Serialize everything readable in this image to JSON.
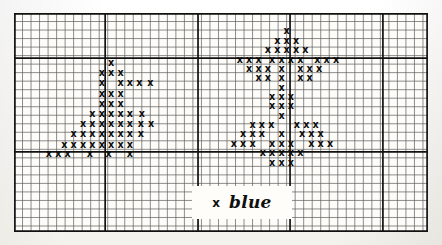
{
  "document": {
    "kind": "cross-stitch-pattern-chart",
    "title": "Cross-stitch chart",
    "paper_color": "#faf9f5",
    "grid_line_color": "#5d5d5d",
    "bold_line_color": "#111111",
    "stitch_color": "#0b0b0b"
  },
  "grid": {
    "left": 14,
    "top": 13,
    "cell_size": 8.52,
    "columns": 48.6,
    "rows": 25.7,
    "bold_columns": [
      0,
      10.7,
      21.6,
      32.4,
      43.3,
      48.6
    ],
    "bold_rows": [
      0,
      5.3,
      16.3,
      25.7
    ],
    "fine_lines_visible": true
  },
  "legend": {
    "symbol": "x",
    "label": "blue",
    "box_color": "#fefdfa"
  },
  "chart_data": {
    "type": "heatmap",
    "xlabel": "",
    "ylabel": "",
    "symbol": "x",
    "motifs": [
      {
        "name": "tree-motif",
        "position": "left",
        "rows": [
          {
            "y": 5.8,
            "cols": [
              11.4
            ]
          },
          {
            "y": 7.0,
            "cols": [
              10.3,
              11.4,
              12.5
            ]
          },
          {
            "y": 8.2,
            "cols": [
              10.3,
              12.5,
              13.6,
              14.7,
              16.0
            ]
          },
          {
            "y": 9.4,
            "cols": [
              10.3,
              11.4,
              12.5
            ]
          },
          {
            "y": 10.6,
            "cols": [
              10.3,
              11.4,
              12.5
            ]
          },
          {
            "y": 11.8,
            "cols": [
              9.2,
              10.3,
              11.4,
              12.5,
              13.6,
              15.0
            ]
          },
          {
            "y": 13.0,
            "cols": [
              8.1,
              9.2,
              10.3,
              11.4,
              12.5,
              13.6,
              14.9,
              16.1
            ]
          },
          {
            "y": 14.2,
            "cols": [
              7.0,
              8.1,
              9.2,
              10.3,
              11.4,
              12.5,
              13.6,
              14.9
            ]
          },
          {
            "y": 15.4,
            "cols": [
              5.9,
              7.0,
              8.1,
              9.2,
              10.3,
              11.4,
              12.5,
              13.6
            ]
          },
          {
            "y": 16.5,
            "cols": [
              4.1,
              5.2,
              6.3,
              8.9,
              11.1,
              13.6
            ]
          }
        ]
      },
      {
        "name": "star-motif",
        "position": "right",
        "rows": [
          {
            "y": 2.1,
            "cols": [
              32.0
            ]
          },
          {
            "y": 3.2,
            "cols": [
              30.9,
              32.0,
              33.1
            ]
          },
          {
            "y": 4.3,
            "cols": [
              29.8,
              30.9,
              32.0,
              33.1,
              34.2
            ]
          },
          {
            "y": 5.4,
            "cols": [
              26.5,
              27.6,
              28.7,
              30.3,
              31.4,
              32.5,
              33.6,
              35.6,
              36.7,
              37.8
            ]
          },
          {
            "y": 6.5,
            "cols": [
              27.6,
              28.7,
              29.8,
              31.4,
              33.6,
              34.7,
              35.8
            ]
          },
          {
            "y": 7.6,
            "cols": [
              28.7,
              29.8,
              31.4,
              33.6,
              34.7
            ]
          },
          {
            "y": 8.7,
            "cols": [
              31.4
            ]
          },
          {
            "y": 9.8,
            "cols": [
              30.3,
              31.4,
              32.5
            ]
          },
          {
            "y": 10.9,
            "cols": [
              30.3,
              31.4,
              32.5
            ]
          },
          {
            "y": 12.0,
            "cols": [
              31.4
            ]
          },
          {
            "y": 13.1,
            "cols": [
              28.0,
              29.1,
              30.2,
              33.2,
              34.3,
              35.4
            ]
          },
          {
            "y": 14.2,
            "cols": [
              26.9,
              28.0,
              29.1,
              31.4,
              33.8,
              34.9,
              36.0
            ]
          },
          {
            "y": 15.3,
            "cols": [
              25.8,
              26.9,
              28.0,
              30.3,
              31.4,
              32.5,
              34.9,
              36.0,
              37.1
            ]
          },
          {
            "y": 16.4,
            "cols": [
              29.2,
              30.3,
              31.4,
              32.5,
              33.6
            ]
          },
          {
            "y": 17.5,
            "cols": [
              30.3,
              31.4,
              32.5
            ]
          }
        ]
      }
    ]
  }
}
